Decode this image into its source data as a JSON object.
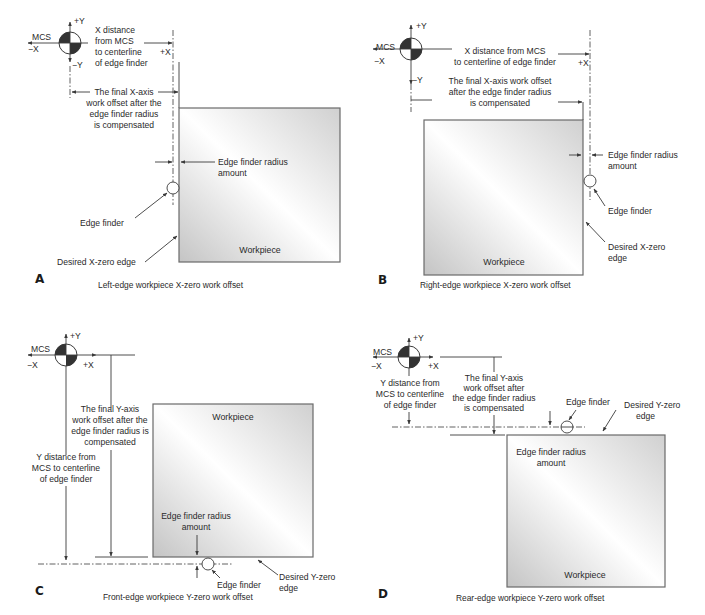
{
  "colors": {
    "line": "#3a3a3a",
    "text": "#2a2a2a",
    "workpiece_border": "#6a6a6a",
    "workpiece_fill_dark": "#c8c8c8",
    "workpiece_fill_light": "#ffffff",
    "mcs_fill": "#333333"
  },
  "panels": {
    "A": {
      "letter": "A",
      "caption": "Left-edge workpiece X-zero work offset",
      "mcs": {
        "label": "MCS",
        "plus_y": "+Y",
        "minus_y": "−Y",
        "minus_x": "−X",
        "plus_x": "+X"
      },
      "x_distance": [
        "X distance",
        "from MCS",
        "to centerline",
        "of edge finder"
      ],
      "final_offset": [
        "The final X-axis",
        "work offset after the",
        "edge finder radius",
        "is compensated"
      ],
      "radius_amount": [
        "Edge finder radius",
        "amount"
      ],
      "edge_finder": "Edge finder",
      "desired_edge": [
        "Desired X-zero edge"
      ],
      "workpiece": "Workpiece"
    },
    "B": {
      "letter": "B",
      "caption": "Right-edge workpiece X-zero work offset",
      "mcs": {
        "label": "MCS",
        "plus_y": "+Y",
        "minus_y": "−Y",
        "minus_x": "−X",
        "plus_x": "+X"
      },
      "x_distance": [
        "X distance from MCS",
        "to centerline of edge finder"
      ],
      "final_offset": [
        "The final X-axis work offset",
        "after the edge finder radius",
        "is compensated"
      ],
      "radius_amount": [
        "Edge finder radius",
        "amount"
      ],
      "edge_finder": "Edge finder",
      "desired_edge": [
        "Desired X-zero",
        "edge"
      ],
      "workpiece": "Workpiece"
    },
    "C": {
      "letter": "C",
      "caption": "Front-edge workpiece Y-zero work offset",
      "mcs": {
        "label": "MCS",
        "plus_y": "+Y",
        "minus_x": "−X",
        "plus_x": "+X"
      },
      "y_distance": [
        "Y distance from",
        "MCS to centerline",
        "of edge finder"
      ],
      "final_offset": [
        "The final Y-axis",
        "work offset after the",
        "edge finder radius is",
        "compensated"
      ],
      "radius_amount": [
        "Edge finder radius",
        "amount"
      ],
      "edge_finder": "Edge finder",
      "desired_edge": [
        "Desired Y-zero",
        "edge"
      ],
      "workpiece": "Workpiece"
    },
    "D": {
      "letter": "D",
      "caption": "Rear-edge workpiece Y-zero work offset",
      "mcs": {
        "label": "MCS",
        "plus_y": "+Y",
        "minus_x": "−X",
        "plus_x": "+X"
      },
      "y_distance": [
        "Y distance from",
        "MCS to centerline",
        "of edge finder"
      ],
      "final_offset": [
        "The final Y-axis",
        "work offset after",
        "the edge finder radius",
        "is compensated"
      ],
      "radius_amount": [
        "Edge finder radius",
        "amount"
      ],
      "edge_finder": "Edge finder",
      "desired_edge": [
        "Desired Y-zero",
        "edge"
      ],
      "workpiece": "Workpiece"
    }
  }
}
